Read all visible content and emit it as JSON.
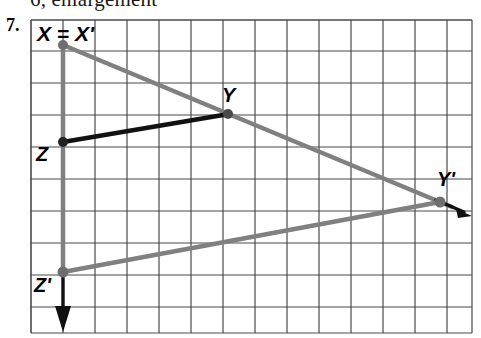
{
  "page": {
    "problem_number": "7.",
    "cutoff_text_above": "6, enlargement"
  },
  "figure": {
    "colors": {
      "grid_line": "#4a4a4a",
      "grid_background": "#ffffff",
      "image_triangle": "#808080",
      "object_segment": "#111111",
      "vertex_dot": "#6e6e6e"
    },
    "labels": {
      "x": "X = X'",
      "y": "Y",
      "z": "Z",
      "y_prime": "Y'",
      "z_prime": "Z'"
    },
    "points": {
      "X": {
        "label": "X = X'",
        "px": [
          63,
          45
        ]
      },
      "Y": {
        "label": "Y",
        "px": [
          228,
          114
        ]
      },
      "Z": {
        "label": "Z",
        "px": [
          63,
          142
        ]
      },
      "Yp": {
        "label": "Y'",
        "px": [
          440,
          202
        ]
      },
      "Zp": {
        "label": "Z'",
        "px": [
          63,
          272
        ]
      }
    },
    "grid": {
      "left": 31,
      "top": 20,
      "right": 472,
      "bottom": 333,
      "cell_size": 32,
      "columns": 14,
      "rows": 10
    },
    "segments": [
      {
        "name": "X-to-Yprime",
        "color": "image_triangle",
        "width": 4
      },
      {
        "name": "Yprime-to-Zprime",
        "color": "image_triangle",
        "width": 4
      },
      {
        "name": "X-to-Zprime",
        "color": "image_triangle",
        "width": 4
      },
      {
        "name": "Z-to-Y",
        "color": "object_segment",
        "width": 4
      }
    ],
    "arrows": [
      {
        "name": "ray-through-Yprime",
        "direction": "down-right",
        "color": "object_segment"
      },
      {
        "name": "ray-through-Zprime",
        "direction": "down",
        "color": "object_segment"
      }
    ]
  }
}
